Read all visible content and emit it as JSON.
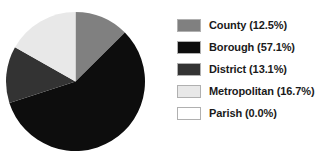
{
  "chart_data": {
    "type": "pie",
    "title": "",
    "categories": [
      "County",
      "Borough",
      "District",
      "Metropolitan",
      "Parish"
    ],
    "values": [
      12.5,
      57.1,
      13.1,
      16.7,
      0.0
    ],
    "value_unit": "%",
    "colors": [
      "#808080",
      "#0d0d0d",
      "#333333",
      "#e8e8e8",
      "#ffffff"
    ],
    "start_angle_deg": 0,
    "direction": "clockwise",
    "legend_position": "right",
    "grid": false,
    "slices": [
      {
        "label": "County",
        "value": 12.5,
        "angle_deg": 45.0,
        "color": "#808080",
        "legend_text": "County (12.5%)"
      },
      {
        "label": "Borough",
        "value": 57.1,
        "angle_deg": 205.6,
        "color": "#0d0d0d",
        "legend_text": "Borough (57.1%)"
      },
      {
        "label": "District",
        "value": 13.1,
        "angle_deg": 47.2,
        "color": "#333333",
        "legend_text": "District (13.1%)"
      },
      {
        "label": "Metropolitan",
        "value": 16.7,
        "angle_deg": 60.1,
        "color": "#e8e8e8",
        "legend_text": "Metropolitan (16.7%)"
      },
      {
        "label": "Parish",
        "value": 0.0,
        "angle_deg": 0.0,
        "color": "#ffffff",
        "legend_text": "Parish (0.0%)"
      }
    ]
  },
  "legend": {
    "items": [
      {
        "label": "County (12.5%)",
        "color": "#808080",
        "swatch_name": "legend-swatch-county"
      },
      {
        "label": "Borough (57.1%)",
        "color": "#0d0d0d",
        "swatch_name": "legend-swatch-borough"
      },
      {
        "label": "District (13.1%)",
        "color": "#333333",
        "swatch_name": "legend-swatch-district"
      },
      {
        "label": "Metropolitan (16.7%)",
        "color": "#e8e8e8",
        "swatch_name": "legend-swatch-metropolitan"
      },
      {
        "label": "Parish (0.0%)",
        "color": "#ffffff",
        "swatch_name": "legend-swatch-parish"
      }
    ]
  }
}
